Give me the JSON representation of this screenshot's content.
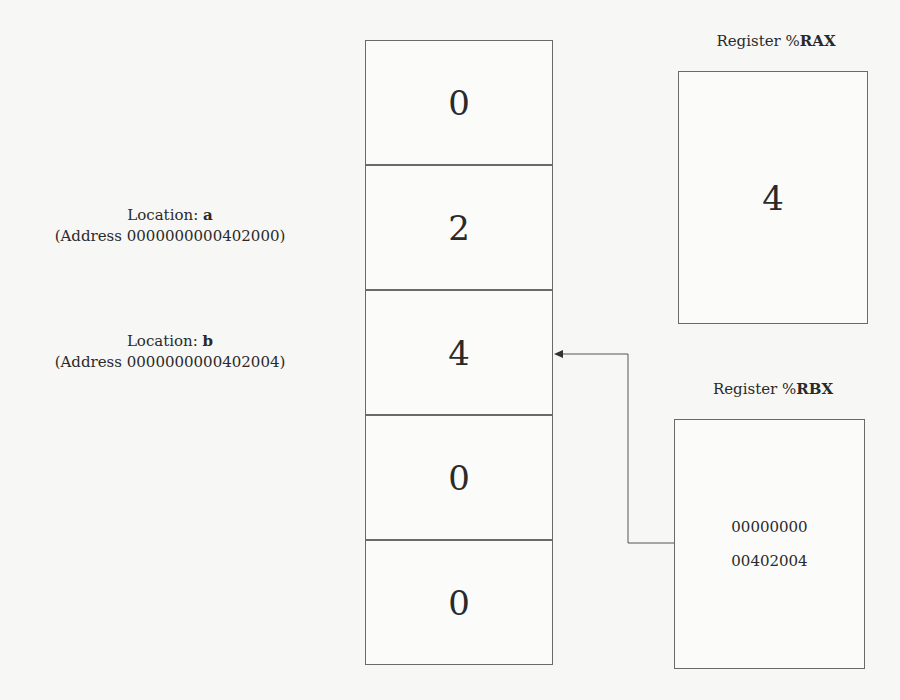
{
  "memory": {
    "cells": [
      {
        "value": "0"
      },
      {
        "value": "2"
      },
      {
        "value": "4"
      },
      {
        "value": "0"
      },
      {
        "value": "0"
      }
    ],
    "labels": [
      {
        "prefix": "Location: ",
        "name": "a",
        "address": "(Address 0000000000402000)"
      },
      {
        "prefix": "Location: ",
        "name": "b",
        "address": "(Address 0000000000402004)"
      }
    ]
  },
  "registers": {
    "rax": {
      "title_prefix": "Register %",
      "title_name": "RAX",
      "value": "4"
    },
    "rbx": {
      "title_prefix": "Register %",
      "title_name": "RBX",
      "value_line1": "00000000",
      "value_line2": "00402004"
    }
  },
  "pointer_arrow": {
    "from": "rbx",
    "to": "memory.cells.2"
  }
}
